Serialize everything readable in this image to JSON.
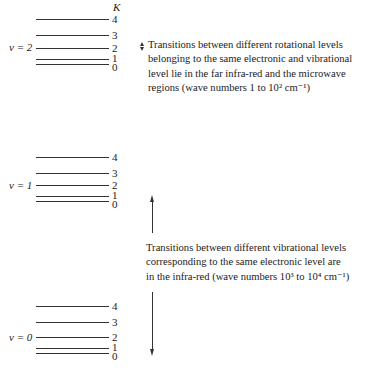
{
  "k_header": "K",
  "levels": [
    {
      "v_label": "v = 2",
      "k_labels": [
        "4",
        "3",
        "2",
        "1",
        "0"
      ]
    },
    {
      "v_label": "v = 1",
      "k_labels": [
        "4",
        "3",
        "2",
        "1",
        "0"
      ]
    },
    {
      "v_label": "v = 0",
      "k_labels": [
        "4",
        "3",
        "2",
        "1",
        "0"
      ]
    }
  ],
  "rotational_note": {
    "lines": [
      "Transitions between different rotational levels",
      "belonging to the same electronic and vibrational",
      "level lie in the far infra-red and the microwave",
      "regions (wave numbers 1 to 10² cm⁻¹)"
    ]
  },
  "vibrational_note": {
    "lines": [
      "Transitions between different vibrational levels",
      "corresponding to the same electronic level are",
      "in the infra-red (wave numbers 10³ to 10⁴ cm⁻¹)"
    ]
  }
}
